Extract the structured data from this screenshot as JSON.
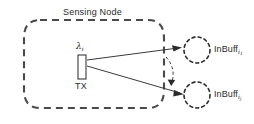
{
  "figure": {
    "title": "Sensing Node",
    "transmitter": {
      "antenna_label_base": "λ",
      "antenna_label_sub": "i",
      "name": "TX"
    },
    "buffers": [
      {
        "label_base": "InBuff",
        "label_sub": "i",
        "label_subsub": "1"
      },
      {
        "label_base": "InBuff",
        "label_sub": "i",
        "label_subsub": "j"
      }
    ],
    "colors": {
      "stroke": "#3a3a3a",
      "dashed_boundary": "#4a4a4a",
      "text": "#2b2b2b",
      "background": "#ffffff"
    }
  }
}
